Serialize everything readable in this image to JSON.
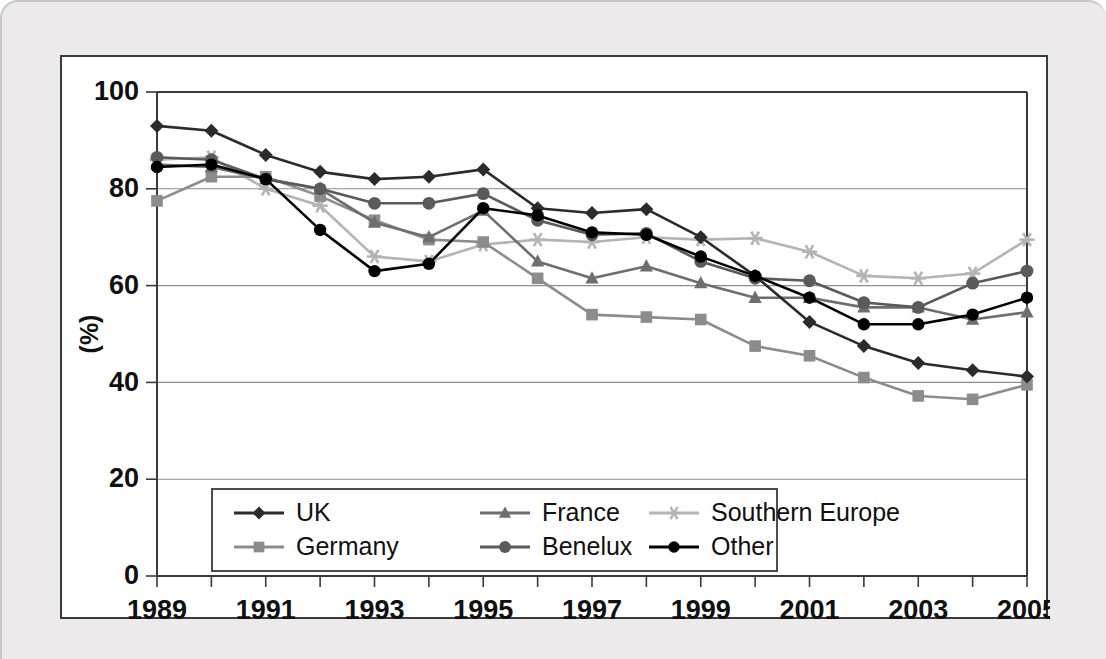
{
  "chart_data": {
    "type": "line",
    "title": "",
    "xlabel": "",
    "ylabel": "(%)",
    "xlim": [
      1989,
      2005
    ],
    "ylim": [
      0,
      100
    ],
    "grid": true,
    "legend_position": "inside-bottom-left",
    "x": [
      1989,
      1990,
      1991,
      1992,
      1993,
      1994,
      1995,
      1996,
      1997,
      1998,
      1999,
      2000,
      2001,
      2002,
      2003,
      2004,
      2005
    ],
    "xtick_labels": [
      "1989",
      "1991",
      "1993",
      "1995",
      "1997",
      "1999",
      "2001",
      "2003",
      "2005"
    ],
    "ytick_labels": [
      "0",
      "20",
      "40",
      "60",
      "80",
      "100"
    ],
    "yticks": [
      0,
      20,
      40,
      60,
      80,
      100
    ],
    "series": [
      {
        "name": "UK",
        "marker": "diamond",
        "color": "#2b2b2b",
        "values": [
          93.0,
          92.0,
          87.0,
          83.5,
          82.0,
          82.5,
          84.0,
          76.0,
          75.0,
          75.8,
          70.0,
          62.0,
          52.5,
          47.5,
          44.0,
          42.5,
          41.2
        ]
      },
      {
        "name": "France",
        "marker": "triangle",
        "color": "#6e6e6e",
        "values": [
          85.0,
          84.5,
          82.0,
          80.0,
          73.0,
          70.0,
          75.5,
          65.0,
          61.5,
          64.0,
          60.5,
          57.5,
          57.5,
          55.5,
          55.5,
          53.0,
          54.5
        ]
      },
      {
        "name": "Southern Europe",
        "marker": "asterisk",
        "color": "#b4b4b4",
        "values": [
          86.0,
          86.5,
          80.0,
          76.5,
          66.0,
          65.0,
          68.5,
          69.5,
          69.0,
          70.0,
          69.5,
          69.8,
          67.0,
          62.0,
          61.5,
          62.5,
          69.5
        ]
      },
      {
        "name": "Germany",
        "marker": "square",
        "color": "#8c8c8c",
        "values": [
          77.5,
          82.5,
          82.5,
          78.5,
          73.5,
          69.5,
          69.0,
          61.5,
          54.0,
          53.5,
          53.0,
          47.5,
          45.5,
          41.0,
          37.2,
          36.5,
          39.5
        ]
      },
      {
        "name": "Benelux",
        "marker": "circle",
        "color": "#5a5a5a",
        "values": [
          86.5,
          86.0,
          82.0,
          80.0,
          77.0,
          77.0,
          79.0,
          73.5,
          70.5,
          70.8,
          65.0,
          61.5,
          61.0,
          56.5,
          55.5,
          60.5,
          63.0
        ]
      },
      {
        "name": "Other",
        "marker": "dot",
        "color": "#000000",
        "values": [
          84.5,
          85.0,
          82.0,
          71.5,
          63.0,
          64.5,
          76.0,
          74.5,
          71.0,
          70.5,
          66.0,
          62.0,
          57.5,
          52.0,
          52.0,
          54.0,
          57.5
        ]
      }
    ]
  },
  "legend": {
    "entries": [
      {
        "label": "UK"
      },
      {
        "label": "France"
      },
      {
        "label": "Southern Europe"
      },
      {
        "label": "Germany"
      },
      {
        "label": "Benelux"
      },
      {
        "label": "Other"
      }
    ]
  }
}
